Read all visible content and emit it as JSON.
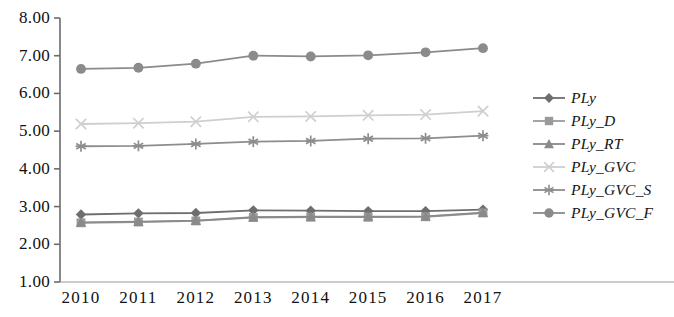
{
  "chart_data": {
    "type": "line",
    "title": "",
    "xlabel": "",
    "ylabel": "",
    "categories": [
      "2010",
      "2011",
      "2012",
      "2013",
      "2014",
      "2015",
      "2016",
      "2017"
    ],
    "ylim": [
      1.0,
      8.0
    ],
    "ytick_labels": [
      "8.00",
      "7.00",
      "6.00",
      "5.00",
      "4.00",
      "3.00",
      "2.00",
      "1.00"
    ],
    "ytick_values": [
      8.0,
      7.0,
      6.0,
      5.0,
      4.0,
      3.0,
      2.0,
      1.0
    ],
    "grid": false,
    "legend_position": "right",
    "series": [
      {
        "name": "PLy",
        "marker": "diamond",
        "color": "#6e6e6e",
        "values": [
          2.79,
          2.82,
          2.83,
          2.9,
          2.89,
          2.88,
          2.88,
          2.92
        ]
      },
      {
        "name": "PLy_D",
        "marker": "square",
        "color": "#9a9a9a",
        "values": [
          2.57,
          2.59,
          2.62,
          2.71,
          2.72,
          2.72,
          2.73,
          2.83
        ]
      },
      {
        "name": "PLy_RT",
        "marker": "triangle",
        "color": "#8a8a8a",
        "values": [
          2.58,
          2.6,
          2.63,
          2.72,
          2.73,
          2.73,
          2.74,
          2.84
        ]
      },
      {
        "name": "PLy_GVC",
        "marker": "x",
        "color": "#cfcfcf",
        "values": [
          5.19,
          5.21,
          5.25,
          5.38,
          5.39,
          5.42,
          5.44,
          5.53
        ]
      },
      {
        "name": "PLy_GVC_S",
        "marker": "asterisk",
        "color": "#8d8d8d",
        "values": [
          4.6,
          4.61,
          4.66,
          4.72,
          4.74,
          4.8,
          4.81,
          4.88
        ]
      },
      {
        "name": "PLy_GVC_F",
        "marker": "circle",
        "color": "#8b8b8b",
        "values": [
          6.65,
          6.68,
          6.79,
          7.0,
          6.98,
          7.01,
          7.09,
          7.2
        ]
      }
    ]
  },
  "legend": {
    "items": [
      {
        "label": "PLy"
      },
      {
        "label": "PLy_D"
      },
      {
        "label": "PLy_RT"
      },
      {
        "label": "PLy_GVC"
      },
      {
        "label": "PLy_GVC_S"
      },
      {
        "label": "PLy_GVC_F"
      }
    ]
  },
  "axes": {
    "y_labels": [
      "8.00",
      "7.00",
      "6.00",
      "5.00",
      "4.00",
      "3.00",
      "2.00",
      "1.00"
    ],
    "x_labels": [
      "2010",
      "2011",
      "2012",
      "2013",
      "2014",
      "2015",
      "2016",
      "2017"
    ]
  },
  "colors": {
    "axis": "#6b6b6b",
    "text": "#111111"
  }
}
